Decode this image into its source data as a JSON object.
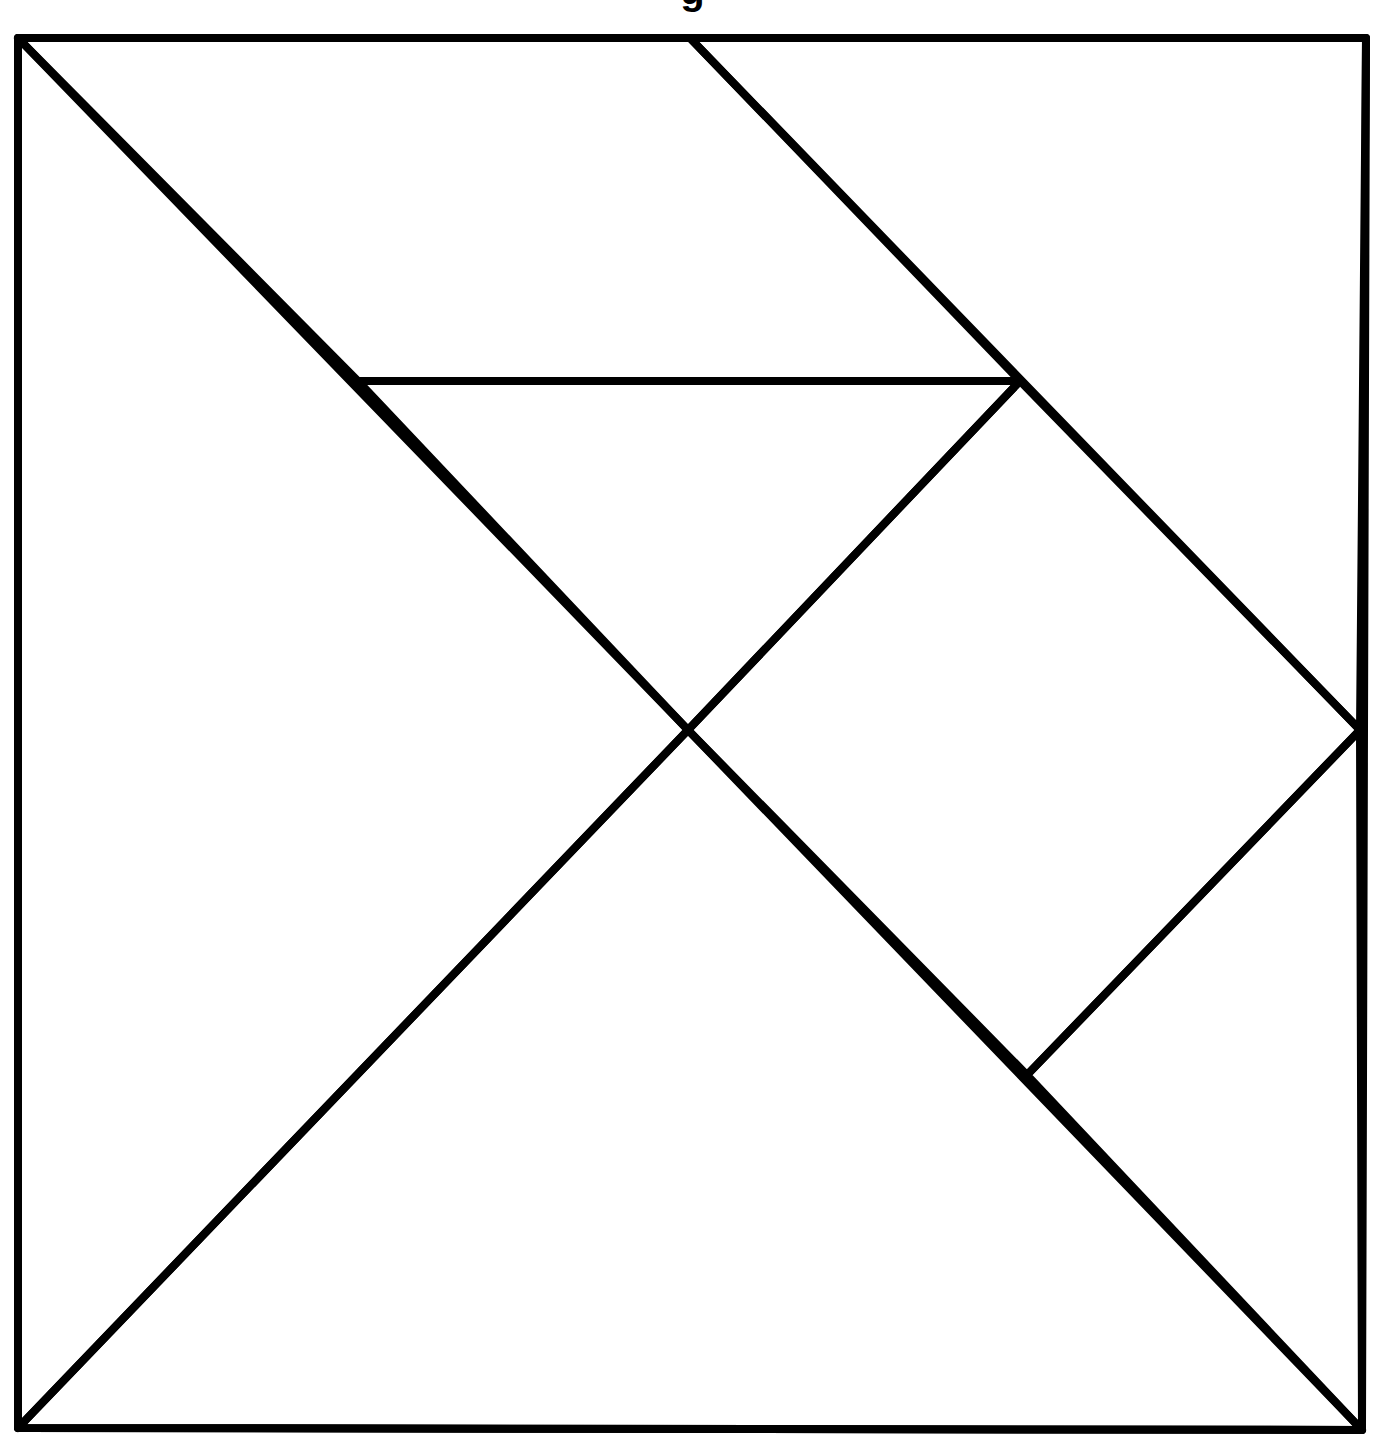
{
  "diagram": {
    "type": "tangram",
    "caption_fragment": "g",
    "stroke_color": "#000000",
    "background_color": "#ffffff",
    "stroke_width": 8,
    "outer_square": {
      "top_left": [
        18,
        38
      ],
      "top_right": [
        1366,
        38
      ],
      "bottom_right": [
        1362,
        1430
      ],
      "bottom_left": [
        18,
        1428
      ]
    },
    "key_points": {
      "center": [
        688,
        730
      ],
      "top_mid": [
        690,
        38
      ],
      "right_mid": [
        1360,
        730
      ],
      "inner_left": [
        358,
        381
      ],
      "inner_right": [
        1020,
        381
      ],
      "lower_right_joint": [
        1027,
        1075
      ]
    },
    "pieces": [
      {
        "name": "large-triangle-left",
        "points": [
          [
            18,
            38
          ],
          [
            688,
            730
          ],
          [
            18,
            1428
          ]
        ]
      },
      {
        "name": "large-triangle-bottom",
        "points": [
          [
            18,
            1428
          ],
          [
            688,
            730
          ],
          [
            1362,
            1430
          ]
        ]
      },
      {
        "name": "parallelogram-top",
        "points": [
          [
            18,
            38
          ],
          [
            690,
            38
          ],
          [
            1020,
            381
          ],
          [
            358,
            381
          ]
        ]
      },
      {
        "name": "small-triangle-middle",
        "points": [
          [
            358,
            381
          ],
          [
            1020,
            381
          ],
          [
            688,
            730
          ]
        ]
      },
      {
        "name": "medium-triangle-top-right",
        "points": [
          [
            690,
            38
          ],
          [
            1366,
            38
          ],
          [
            1360,
            730
          ]
        ]
      },
      {
        "name": "square-right",
        "points": [
          [
            1020,
            381
          ],
          [
            1360,
            730
          ],
          [
            1027,
            1075
          ],
          [
            688,
            730
          ]
        ]
      },
      {
        "name": "small-triangle-bottom-right",
        "points": [
          [
            1360,
            730
          ],
          [
            1362,
            1430
          ],
          [
            1027,
            1075
          ]
        ]
      }
    ]
  }
}
